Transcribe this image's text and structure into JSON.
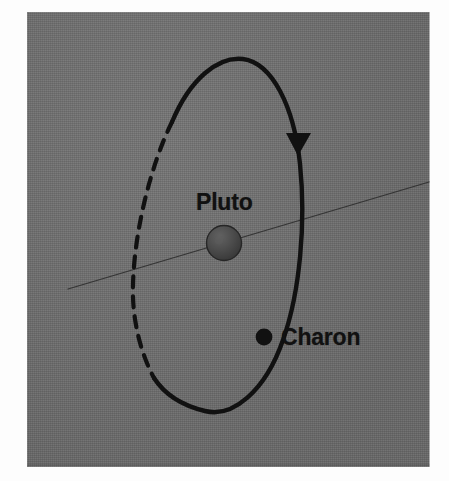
{
  "figure": {
    "background_color": "#ffffff",
    "plate_color": "#6d6d6d",
    "ink_color": "#111111"
  },
  "labels": {
    "pluto": "Pluto",
    "charon": "Charon"
  },
  "bodies": [
    {
      "name": "Pluto",
      "kind": "planet-sphere",
      "center_x": 224,
      "center_y": 243,
      "radius": 17,
      "fill": "#4a4a4a"
    },
    {
      "name": "Charon",
      "kind": "moon-dot",
      "center_x": 264,
      "center_y": 337,
      "radius": 8,
      "fill": "#111111"
    }
  ],
  "orbit": {
    "name": "Charon orbit ellipse",
    "center_x": 216,
    "center_y": 234,
    "radius_x": 85,
    "radius_y": 176,
    "rotation_deg": 14,
    "stroke": "#111111",
    "stroke_width": 4.2,
    "near_side": "solid",
    "far_side": "dashed",
    "dash_pattern": "11 9",
    "direction_arrow": {
      "name": "orbit-direction-arrow",
      "shape": "triangle",
      "points_toward": "down",
      "tip_x": 302,
      "tip_y": 155
    }
  },
  "ecliptic_line": {
    "name": "ecliptic plane line",
    "x1": 68,
    "y1": 289,
    "x2": 429,
    "y2": 182,
    "stroke": "#2e2e2e",
    "stroke_width": 1.2
  }
}
